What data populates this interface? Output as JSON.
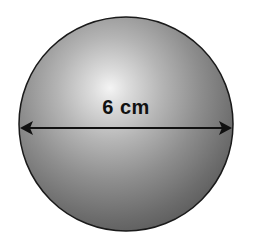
{
  "figure": {
    "shape": "sphere",
    "dimension_label": "6 cm",
    "dimension_type": "diameter",
    "colors": {
      "background": "#ffffff",
      "sphere_highlight": "#f2f2f2",
      "sphere_mid": "#a8a8a8",
      "sphere_shadow": "#5e5e5e",
      "outline": "#1a1a1a",
      "arrow": "#111111",
      "label": "#111111"
    }
  }
}
